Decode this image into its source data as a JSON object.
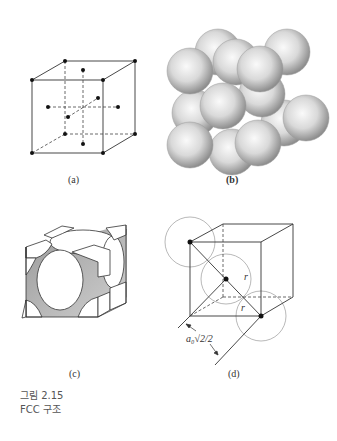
{
  "figure": {
    "number_label": "그림 2.15",
    "title": "FCC 구조",
    "panels": [
      {
        "id": "a",
        "label": "(a)",
        "description": "FCC unit cell lattice points: 8 corners + 6 face centers"
      },
      {
        "id": "b",
        "label": "(b)",
        "description": "Hard-sphere packing of FCC unit cell"
      },
      {
        "id": "c",
        "label": "(c)",
        "description": "Unit cell with truncated atoms (corner eighths and face halves)"
      },
      {
        "id": "d",
        "label": "(d)",
        "description": "Face diagonal showing atoms touching",
        "annotations": {
          "radius_1": "r",
          "radius_2": "r",
          "dimension": "a₀√2/2"
        }
      }
    ]
  },
  "colors": {
    "line": "#333333",
    "dashed": "#444444",
    "dot": "#111111",
    "circle": "#888888",
    "sphere_light": "#f4f4f4",
    "sphere_dark": "#8a8a8a"
  }
}
